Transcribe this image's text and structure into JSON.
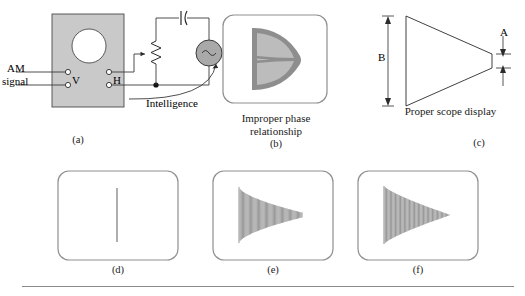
{
  "figure": {
    "background": "#ffffff",
    "rule_color": "#8a8a8a"
  },
  "colors": {
    "chassis_gray": "#c9c9c9",
    "wire": "#3a3a3a",
    "scope_border": "#8f8f8f",
    "trace_gray": "#9a9a9a",
    "pattern_dark": "#8e8e8e",
    "pattern_light": "#bcbcbc",
    "source_fill": "#a9a9a9"
  },
  "panel_a": {
    "letter": "(a)",
    "input_label_line1": "AM",
    "input_label_line2": "signal",
    "terminal_v": "V",
    "terminal_h": "H",
    "intelligence_label": "Intelligence",
    "source_symbol": "~",
    "components": [
      {
        "name": "capacitor",
        "symbol": "capacitor-icon"
      },
      {
        "name": "potentiometer",
        "symbol": "potentiometer-icon"
      },
      {
        "name": "ac-source",
        "symbol": "ac-source-icon"
      }
    ]
  },
  "panel_b": {
    "letter": "(b)",
    "caption": "Improper phase\nrelationship",
    "pattern": "crossed-lobes-trapezoid"
  },
  "panel_c": {
    "letter": "(c)",
    "caption": "Proper scope display",
    "dim_b": "B",
    "dim_a": "A",
    "pattern": "trapezoid-outline"
  },
  "panel_d": {
    "letter": "(d)",
    "pattern": "vertical-line",
    "description": "unmodulated vertical line"
  },
  "panel_e": {
    "letter": "(e)",
    "pattern": "trapezoid-envelope-blunt",
    "description": "trapezoidal pattern tapering to blunt tip"
  },
  "panel_f": {
    "letter": "(f)",
    "pattern": "trapezoid-envelope-point",
    "description": "trapezoidal pattern tapering to sharp point"
  }
}
